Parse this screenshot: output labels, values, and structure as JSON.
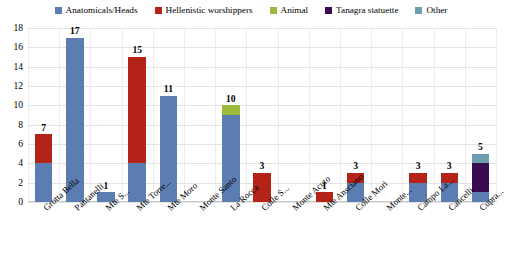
{
  "chart_data": {
    "type": "bar",
    "stacked": true,
    "title": "",
    "xlabel": "",
    "ylabel": "",
    "ylim": [
      0,
      18
    ],
    "yticks": [
      0,
      2,
      4,
      6,
      8,
      10,
      12,
      14,
      16,
      18
    ],
    "grid": true,
    "legend_position": "top",
    "categories": [
      "Grotta Bella",
      "Pantanelli",
      "Mte S...",
      "Mte Torre...",
      "Mte Moro",
      "Monte Santo",
      "La Rocca",
      "Colle S...",
      "Monte Acuto",
      "Mte Ansciano",
      "Colle Mori",
      "Monte...",
      "Campo La...",
      "Cancelli",
      "Cupra..."
    ],
    "series": [
      {
        "name": "Anatomicals/Heads",
        "color": "#5B7DB1",
        "values": [
          4,
          17,
          1,
          4,
          11,
          0,
          9,
          0,
          0,
          0,
          2,
          0,
          2,
          2,
          1
        ]
      },
      {
        "name": "Hellenistic worshippers",
        "color": "#B32317",
        "values": [
          3,
          0,
          0,
          11,
          0,
          0,
          0,
          3,
          0,
          1,
          1,
          0,
          1,
          1,
          0
        ]
      },
      {
        "name": "Animal",
        "color": "#9BBB3C",
        "values": [
          0,
          0,
          0,
          0,
          0,
          0,
          1,
          0,
          0,
          0,
          0,
          0,
          0,
          0,
          0
        ]
      },
      {
        "name": "Tanagra statuette",
        "color": "#3B0B50",
        "values": [
          0,
          0,
          0,
          0,
          0,
          0,
          0,
          0,
          0,
          0,
          0,
          0,
          0,
          0,
          3
        ]
      },
      {
        "name": "Other",
        "color": "#6E9CB0",
        "values": [
          0,
          0,
          0,
          0,
          0,
          0,
          0,
          0,
          0,
          0,
          0,
          0,
          0,
          0,
          1
        ]
      }
    ],
    "totals": [
      7,
      17,
      1,
      15,
      11,
      0,
      10,
      3,
      0,
      1,
      3,
      0,
      3,
      3,
      5
    ],
    "total_labels": [
      "7",
      "17",
      "1",
      "15",
      "11",
      "",
      "10",
      "3",
      "",
      "1",
      "3",
      "",
      "3",
      "3",
      "5"
    ]
  },
  "colors": {
    "gridline": "#e3e3e3",
    "background": "#ffffff",
    "axis_text": "#000000"
  }
}
